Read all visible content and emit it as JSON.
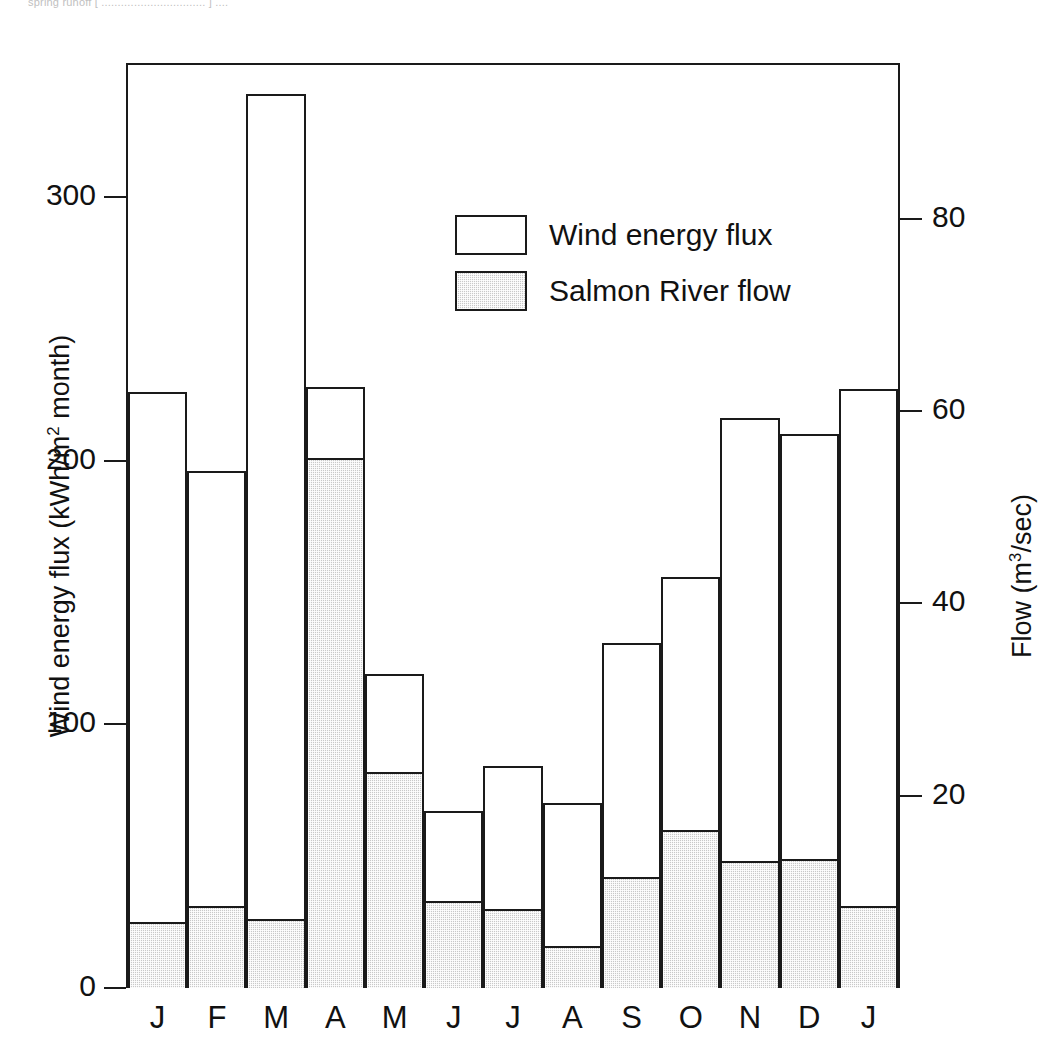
{
  "top_caption": "spring runoff [ ................................ ] ....",
  "chart_data": {
    "type": "bar",
    "title": "",
    "subtitle": "",
    "xlabel": "",
    "ylabel": "Wind energy flux (kWh/m2 month)",
    "ylabel_right": "Flow (m3/sec)",
    "categories": [
      "J",
      "F",
      "M",
      "A",
      "M",
      "J",
      "J",
      "A",
      "S",
      "O",
      "N",
      "D",
      "J"
    ],
    "ylim": [
      0,
      350
    ],
    "yticks": [
      0,
      100,
      200,
      300
    ],
    "ytick_labels": [
      "0",
      "100",
      "200",
      "300"
    ],
    "ylim_right": [
      0,
      96
    ],
    "yticks_right": [
      20,
      40,
      60,
      80
    ],
    "ytick_labels_right": [
      "20",
      "40",
      "60",
      "80"
    ],
    "grid": false,
    "legend_position": "upper-center",
    "series": [
      {
        "name": "Wind energy flux",
        "axis": "left",
        "units": "kWh/m2 month",
        "color": "#ffffff",
        "values": [
          226,
          196,
          339,
          228,
          119,
          67,
          84,
          70,
          131,
          156,
          216,
          210,
          227
        ]
      },
      {
        "name": "Salmon River flow",
        "axis": "right",
        "units": "m3/sec",
        "color": "#c9c9c9",
        "values": [
          7.0,
          8.5,
          7.2,
          55.5,
          22.5,
          9.0,
          8.2,
          4.5,
          11.5,
          16.5,
          13.2,
          13.5,
          8.5
        ],
        "values_in_left_units": [
          25,
          31,
          26,
          201,
          82,
          33,
          30,
          16,
          42,
          60,
          48,
          49,
          31
        ]
      }
    ]
  },
  "legend": {
    "items": [
      {
        "label": "Wind energy flux",
        "swatch": "white"
      },
      {
        "label": "Salmon River flow",
        "swatch": "shaded"
      }
    ]
  },
  "axes": {
    "left_title_pre": "Wind energy flux (kWh/m",
    "left_title_sup": "2",
    "left_title_post": " month)",
    "right_title_pre": "Flow (m",
    "right_title_sup": "3",
    "right_title_post": "/sec)"
  },
  "colors": {
    "ink": "#1a1a1a",
    "flow_fill": "#c9c9c9",
    "flux_fill": "#ffffff",
    "background": "#ffffff"
  }
}
